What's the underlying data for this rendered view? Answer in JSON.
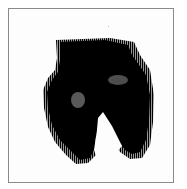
{
  "figure": {
    "kind": "scanned halftone image",
    "frame_color": "#8a8a8a",
    "ink_color": "#000000",
    "background_color": "#ffffff"
  }
}
